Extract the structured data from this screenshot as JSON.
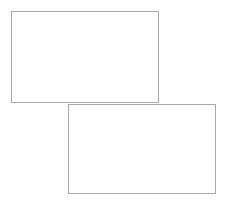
{
  "canvas": {
    "width": 227,
    "height": 205,
    "background_color": "#ffffff",
    "description": "Two empty overlapping rectangles outlined in light gray on a white background"
  },
  "shapes": [
    {
      "id": "rectangle-top-left",
      "kind": "rectangle",
      "label": "",
      "x": 11,
      "y": 11,
      "width": 148,
      "height": 92,
      "fill_color": "#ffffff",
      "border_color": "#a9a9a9",
      "border_width": 1,
      "z_index": 1
    },
    {
      "id": "rectangle-bottom-right",
      "kind": "rectangle",
      "label": "",
      "x": 68,
      "y": 104,
      "width": 148,
      "height": 90,
      "fill_color": "#ffffff",
      "border_color": "#a9a9a9",
      "border_width": 1,
      "z_index": 2
    }
  ]
}
